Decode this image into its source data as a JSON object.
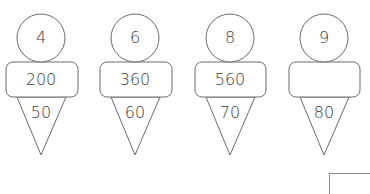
{
  "figures": [
    {
      "circle": "4",
      "box": "200",
      "cone": "50"
    },
    {
      "circle": "6",
      "box": "360",
      "cone": "60"
    },
    {
      "circle": "8",
      "box": "560",
      "cone": "70"
    },
    {
      "circle": "9",
      "box": "",
      "cone": "80"
    }
  ],
  "colors": {
    "stroke": "#6b6b6b",
    "text": "#3c3c3c",
    "background": "#ffffff"
  }
}
